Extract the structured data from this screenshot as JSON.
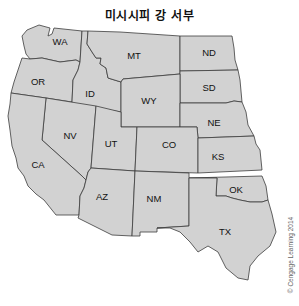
{
  "title": "미시시피 강 서부",
  "copyright": "© Cengage Learning 2014",
  "colors": {
    "state_fill": "#d2d2d2",
    "border": "#3c3c3c",
    "background": "#ffffff"
  },
  "states": [
    {
      "abbr": "WA",
      "x": 60,
      "y": 41
    },
    {
      "abbr": "OR",
      "x": 38,
      "y": 81
    },
    {
      "abbr": "ID",
      "x": 90,
      "y": 93
    },
    {
      "abbr": "MT",
      "x": 134,
      "y": 55
    },
    {
      "abbr": "ND",
      "x": 209,
      "y": 52
    },
    {
      "abbr": "SD",
      "x": 209,
      "y": 87
    },
    {
      "abbr": "WY",
      "x": 149,
      "y": 100
    },
    {
      "abbr": "NE",
      "x": 214,
      "y": 122
    },
    {
      "abbr": "NV",
      "x": 70,
      "y": 135
    },
    {
      "abbr": "UT",
      "x": 111,
      "y": 143
    },
    {
      "abbr": "CO",
      "x": 169,
      "y": 144
    },
    {
      "abbr": "KS",
      "x": 218,
      "y": 156
    },
    {
      "abbr": "CA",
      "x": 38,
      "y": 164
    },
    {
      "abbr": "AZ",
      "x": 102,
      "y": 196
    },
    {
      "abbr": "NM",
      "x": 154,
      "y": 198
    },
    {
      "abbr": "OK",
      "x": 236,
      "y": 189
    },
    {
      "abbr": "TX",
      "x": 225,
      "y": 231
    }
  ]
}
